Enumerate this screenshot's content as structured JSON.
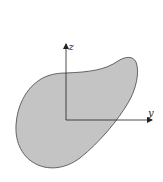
{
  "diagram": {
    "type": "cross-section with coordinate axes",
    "shape": {
      "description": "irregular blob-shaped cross-section",
      "fill": "#c4c4c4",
      "stroke": "#444444"
    },
    "axes": {
      "color": "#222222",
      "origin": [
        66,
        120
      ],
      "z_axis": {
        "label": "z",
        "direction": "up"
      },
      "y_axis": {
        "label": "y",
        "direction": "right"
      }
    }
  }
}
